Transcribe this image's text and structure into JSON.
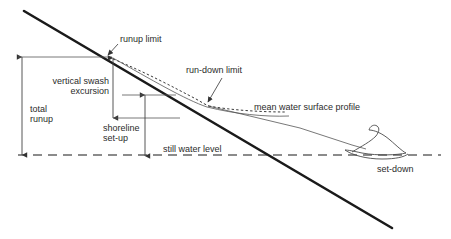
{
  "figure": {
    "background_color": "#ffffff",
    "line_color": "#1a1a1a",
    "text_color": "#2b2b2b"
  },
  "labels": {
    "runup_limit": "runup limit",
    "run_down_limit": "run-down limit",
    "vertical_swash_line1": "vertical swash",
    "vertical_swash_line2": "excursion",
    "total_runup_line1": "total",
    "total_runup_line2": "runup",
    "shoreline_setup_line1": "shoreline",
    "shoreline_setup_line2": "set-up",
    "still_water_level": "still water level",
    "mean_water_surface_profile": "mean water surface profile",
    "set_down": "set-down"
  },
  "geometry": {
    "beach_slope": {
      "x1": 24,
      "y1": 11,
      "x2": 392,
      "y2": 228
    },
    "still_water_level_y": 155,
    "runup_limit_point": {
      "x": 112,
      "y": 57
    },
    "run_down_limit_point": {
      "x": 207,
      "y": 105
    },
    "total_runup_span": {
      "x": 22,
      "y_top": 57,
      "y_bottom": 155
    },
    "vertical_swash_span": {
      "x": 113,
      "y_top": 58,
      "y_bottom": 118
    },
    "shoreline_setup_span": {
      "x": 145,
      "y_top": 95,
      "y_bottom": 155
    },
    "wave_crest": {
      "x": 382,
      "y": 128
    }
  }
}
